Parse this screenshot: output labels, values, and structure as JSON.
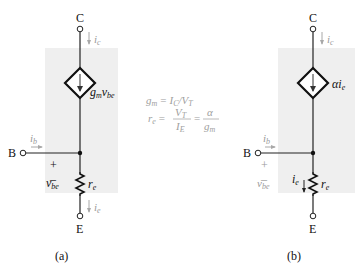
{
  "figure": {
    "left_circuit": {
      "caption": "(a)",
      "terminals": {
        "collector": "C",
        "base": "B",
        "emitter": "E"
      },
      "currents": {
        "collector": "i",
        "collector_sub": "c",
        "base": "i",
        "base_sub": "b",
        "emitter": "i",
        "emitter_sub": "e"
      },
      "source_label_main": "g",
      "source_label_sub1": "m",
      "source_label_v": "v",
      "source_label_sub2": "be",
      "resistor_label": "r",
      "resistor_sub": "e",
      "voltage_label": "v",
      "voltage_sub": "be",
      "plus": "+",
      "minus": "–"
    },
    "equations": {
      "line1_lhs": "g",
      "line1_lhs_sub": "m",
      "line1_eq": "=",
      "line1_rhs": "I",
      "line1_rhs_sub": "C",
      "line1_slash": "/",
      "line1_rhs2": "V",
      "line1_rhs2_sub": "T",
      "line2_lhs": "r",
      "line2_lhs_sub": "e",
      "line2_eq": "=",
      "frac1_num": "V",
      "frac1_num_sub": "T",
      "frac1_den": "I",
      "frac1_den_sub": "E",
      "line2_eq2": "=",
      "frac2_num": "α",
      "frac2_den": "g",
      "frac2_den_sub": "m"
    },
    "right_circuit": {
      "caption": "(b)",
      "terminals": {
        "collector": "C",
        "base": "B",
        "emitter": "E"
      },
      "currents": {
        "collector": "i",
        "collector_sub": "c",
        "base": "i",
        "base_sub": "b",
        "emitter_branch": "i",
        "emitter_branch_sub": "e"
      },
      "source_label": "αi",
      "source_label_sub": "e",
      "resistor_label": "r",
      "resistor_sub": "e",
      "voltage_label": "v",
      "voltage_sub": "be",
      "plus": "+",
      "minus": "–"
    },
    "colors": {
      "shade": "#efefef",
      "wire": "#222222",
      "current_arrow": "#a8a8a8",
      "equation_text": "#a0a0a0"
    }
  }
}
